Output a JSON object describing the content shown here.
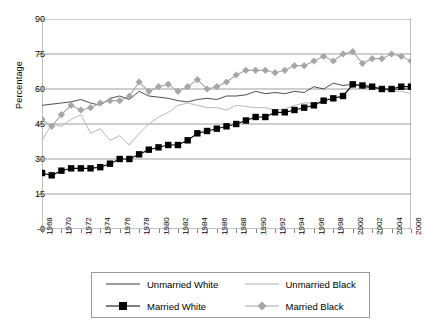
{
  "chart_data": {
    "type": "line",
    "title": "",
    "xlabel": "",
    "ylabel": "Percentage",
    "ylim": [
      0,
      90
    ],
    "yticks": [
      0,
      15,
      30,
      45,
      60,
      75,
      90
    ],
    "xlim": [
      1968,
      2006
    ],
    "grid": "horizontal",
    "legend_position": "bottom",
    "x": [
      1968,
      1969,
      1970,
      1971,
      1972,
      1973,
      1974,
      1975,
      1976,
      1977,
      1978,
      1979,
      1980,
      1981,
      1982,
      1983,
      1984,
      1985,
      1986,
      1987,
      1988,
      1989,
      1990,
      1991,
      1992,
      1993,
      1994,
      1995,
      1996,
      1997,
      1998,
      1999,
      2000,
      2001,
      2002,
      2003,
      2004,
      2005,
      2006
    ],
    "xtick_labels": [
      "1968",
      "1970",
      "1972",
      "1974",
      "1976",
      "1978",
      "1980",
      "1982",
      "1984",
      "1986",
      "1988",
      "1990",
      "1992",
      "1994",
      "1996",
      "1998",
      "2000",
      "2002",
      "2004",
      "2006"
    ],
    "series": [
      {
        "name": "Unmarried White",
        "color": "#3b3b3b",
        "marker": "none",
        "line": "solid",
        "values": [
          53,
          53.5,
          54,
          54.5,
          55.5,
          54,
          53,
          56,
          57,
          55.5,
          59,
          57,
          56.5,
          56,
          55,
          54.5,
          55.5,
          56,
          55.5,
          57,
          57,
          57.5,
          59,
          58,
          58.5,
          58,
          59,
          58.5,
          61,
          60,
          62.5,
          61.5,
          62,
          61,
          60.5,
          60,
          59.5,
          60,
          60
        ]
      },
      {
        "name": "Unmarried Black",
        "color": "#b0b0b0",
        "marker": "none",
        "line": "solid",
        "values": [
          38,
          45,
          44,
          47,
          49,
          41,
          43,
          38,
          40,
          36,
          41,
          45,
          48,
          50,
          53,
          54,
          53,
          52,
          52,
          51,
          53,
          52.5,
          52,
          52,
          51,
          51.5,
          53,
          54,
          54,
          55,
          56,
          57,
          61,
          62,
          61,
          60,
          59,
          59,
          58
        ]
      },
      {
        "name": "Married White",
        "color": "#000000",
        "marker": "square",
        "line": "solid",
        "values": [
          24,
          23,
          25,
          26,
          26,
          26,
          26.5,
          28,
          30,
          30,
          32,
          34,
          35,
          36,
          36,
          38,
          41,
          42,
          43,
          44,
          45,
          46.5,
          48,
          48,
          50,
          50,
          51,
          52,
          53,
          55,
          56,
          57,
          62,
          61.5,
          61,
          60,
          60,
          61,
          61
        ]
      },
      {
        "name": "Married Black",
        "color": "#a6a6a6",
        "marker": "diamond",
        "line": "solid",
        "values": [
          47,
          44,
          49,
          53,
          51,
          52,
          54,
          55,
          55,
          57,
          63,
          59,
          61,
          62,
          59,
          61,
          64,
          60,
          61,
          63,
          66,
          68,
          68,
          68,
          67,
          68,
          70,
          70,
          72,
          74,
          72,
          75,
          76,
          71,
          73,
          73,
          75,
          74,
          72
        ]
      }
    ]
  },
  "legend": {
    "items": [
      {
        "label": "Unmarried White"
      },
      {
        "label": "Unmarried Black"
      },
      {
        "label": "Married White"
      },
      {
        "label": "Married Black"
      }
    ]
  }
}
